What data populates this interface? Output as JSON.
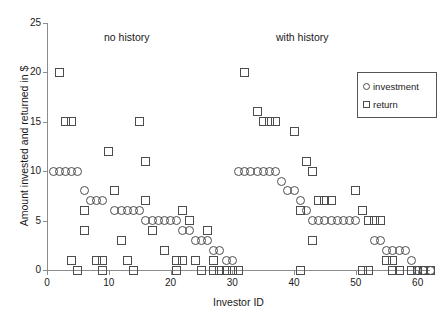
{
  "chart_data": {
    "type": "scatter",
    "title": "",
    "xlabel": "Investor ID",
    "ylabel": "Amount invested and returned in $",
    "xlim": [
      0,
      62
    ],
    "ylim": [
      0,
      25
    ],
    "xticks": [
      0,
      10,
      20,
      30,
      40,
      50,
      60
    ],
    "yticks": [
      0,
      5,
      10,
      15,
      20,
      25
    ],
    "grid": false,
    "legend_position": "top-right",
    "annotations": [
      {
        "text": "no history",
        "x": 10,
        "y": 24
      },
      {
        "text": "with history",
        "x": 40,
        "y": 24
      }
    ],
    "series": [
      {
        "name": "investment",
        "marker": "circle",
        "points": [
          [
            1,
            10
          ],
          [
            2,
            10
          ],
          [
            3,
            10
          ],
          [
            4,
            10
          ],
          [
            5,
            10
          ],
          [
            6,
            8
          ],
          [
            7,
            7
          ],
          [
            8,
            7
          ],
          [
            9,
            7
          ],
          [
            11,
            6
          ],
          [
            12,
            6
          ],
          [
            13,
            6
          ],
          [
            14,
            6
          ],
          [
            15,
            6
          ],
          [
            16,
            5
          ],
          [
            17,
            5
          ],
          [
            18,
            5
          ],
          [
            19,
            5
          ],
          [
            20,
            5
          ],
          [
            21,
            5
          ],
          [
            22,
            4
          ],
          [
            23,
            4
          ],
          [
            24,
            3
          ],
          [
            25,
            3
          ],
          [
            26,
            3
          ],
          [
            27,
            2
          ],
          [
            28,
            2
          ],
          [
            29,
            1
          ],
          [
            30,
            1
          ],
          [
            31,
            10
          ],
          [
            32,
            10
          ],
          [
            33,
            10
          ],
          [
            34,
            10
          ],
          [
            35,
            10
          ],
          [
            36,
            10
          ],
          [
            37,
            10
          ],
          [
            38,
            9
          ],
          [
            39,
            8
          ],
          [
            40,
            8
          ],
          [
            41,
            7
          ],
          [
            42,
            6
          ],
          [
            43,
            5
          ],
          [
            44,
            5
          ],
          [
            45,
            5
          ],
          [
            46,
            5
          ],
          [
            47,
            5
          ],
          [
            48,
            5
          ],
          [
            49,
            5
          ],
          [
            50,
            5
          ],
          [
            53,
            3
          ],
          [
            54,
            3
          ],
          [
            55,
            2
          ],
          [
            56,
            2
          ],
          [
            57,
            2
          ],
          [
            58,
            2
          ],
          [
            59,
            1
          ],
          [
            60,
            0
          ],
          [
            61,
            0
          ],
          [
            62,
            0
          ]
        ]
      },
      {
        "name": "return",
        "marker": "square",
        "points": [
          [
            2,
            20
          ],
          [
            3,
            15
          ],
          [
            4,
            15
          ],
          [
            4,
            1
          ],
          [
            5,
            0
          ],
          [
            6,
            6
          ],
          [
            6,
            4
          ],
          [
            8,
            1
          ],
          [
            9,
            1
          ],
          [
            9,
            0
          ],
          [
            10,
            12
          ],
          [
            11,
            8
          ],
          [
            12,
            3
          ],
          [
            13,
            1
          ],
          [
            14,
            0
          ],
          [
            15,
            15
          ],
          [
            16,
            11
          ],
          [
            16,
            7
          ],
          [
            17,
            4
          ],
          [
            19,
            2
          ],
          [
            21,
            1
          ],
          [
            22,
            1
          ],
          [
            21,
            0
          ],
          [
            22,
            6
          ],
          [
            23,
            5
          ],
          [
            24,
            1
          ],
          [
            25,
            0
          ],
          [
            26,
            4
          ],
          [
            27,
            1
          ],
          [
            27,
            0
          ],
          [
            28,
            0
          ],
          [
            29,
            0
          ],
          [
            30,
            0
          ],
          [
            31,
            0
          ],
          [
            32,
            20
          ],
          [
            34,
            16
          ],
          [
            35,
            15
          ],
          [
            36,
            15
          ],
          [
            37,
            15
          ],
          [
            40,
            14
          ],
          [
            42,
            11
          ],
          [
            43,
            10
          ],
          [
            41,
            6
          ],
          [
            44,
            7
          ],
          [
            45,
            7
          ],
          [
            46,
            7
          ],
          [
            43,
            3
          ],
          [
            41,
            0
          ],
          [
            51,
            6
          ],
          [
            52,
            5
          ],
          [
            53,
            5
          ],
          [
            54,
            5
          ],
          [
            55,
            1
          ],
          [
            56,
            1
          ],
          [
            51,
            0
          ],
          [
            52,
            0
          ],
          [
            56,
            0
          ],
          [
            57,
            0
          ],
          [
            59,
            0
          ],
          [
            60,
            0
          ],
          [
            61,
            0
          ],
          [
            62,
            0
          ],
          [
            50,
            8
          ]
        ]
      }
    ]
  },
  "legend": {
    "entries": [
      {
        "label": "investment",
        "marker": "circle"
      },
      {
        "label": "return",
        "marker": "square"
      }
    ]
  },
  "colors": {
    "marker_stroke": "#4d4d4d",
    "axis": "#8c8c8c",
    "text": "#1a1a1a",
    "background": "#ffffff"
  }
}
